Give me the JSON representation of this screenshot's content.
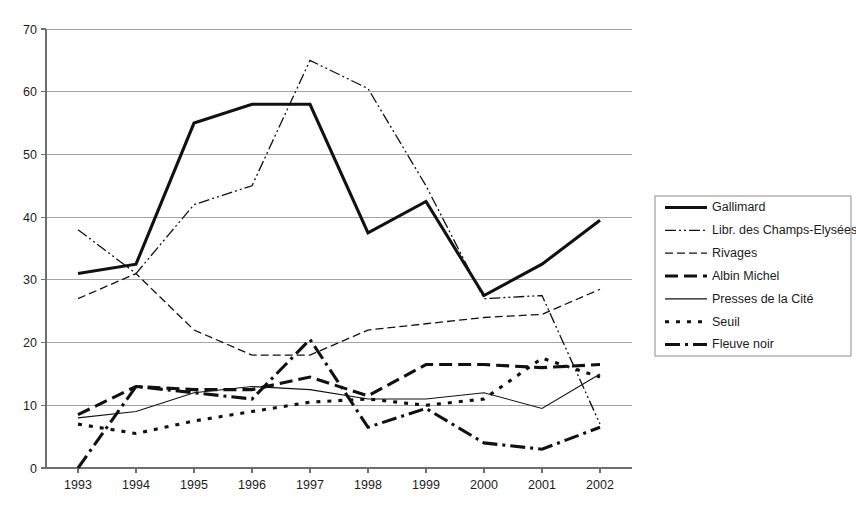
{
  "chart_data": {
    "type": "line",
    "title": "",
    "xlabel": "",
    "ylabel": "",
    "x": [
      1993,
      1994,
      1995,
      1996,
      1997,
      1998,
      1999,
      2000,
      2001,
      2002
    ],
    "categories": [
      "1993",
      "1994",
      "1995",
      "1996",
      "1997",
      "1998",
      "1999",
      "2000",
      "2001",
      "2002"
    ],
    "ylim": [
      0,
      70
    ],
    "yticks": [
      0,
      10,
      20,
      30,
      40,
      50,
      60,
      70
    ],
    "ytick_labels": [
      "0",
      "10",
      "20",
      "30",
      "40",
      "50",
      "60",
      "70"
    ],
    "grid": true,
    "grid_axis": "y",
    "legend_position": "right",
    "series": [
      {
        "name": "Gallimard",
        "values": [
          31,
          32.5,
          55,
          58,
          58,
          37.5,
          42.5,
          27.5,
          32.5,
          39.5
        ],
        "style": "solid-thick",
        "width": 3.1,
        "dash": ""
      },
      {
        "name": "Libr. des Champs-Elysées",
        "values": [
          38,
          31,
          42,
          45,
          65,
          60.5,
          45,
          27,
          27.5,
          7
        ],
        "style": "dash-dot-dot",
        "width": 1.3,
        "dash": "11,3,2,3,2,3"
      },
      {
        "name": "Rivages",
        "values": [
          27,
          31,
          22,
          18,
          18,
          22,
          23,
          24,
          24.5,
          28.5
        ],
        "style": "dashed",
        "width": 1.3,
        "dash": "8,4"
      },
      {
        "name": "Albin Michel",
        "values": [
          8.5,
          13,
          12.5,
          12.5,
          14.5,
          11.5,
          16.5,
          16.5,
          16,
          16.5
        ],
        "style": "dashed-thick",
        "width": 3.1,
        "dash": "13,6"
      },
      {
        "name": "Presses de la Cité",
        "values": [
          8,
          9,
          12,
          13,
          12.5,
          11,
          11,
          12,
          9.5,
          15
        ],
        "style": "solid-thin",
        "width": 1.1,
        "dash": ""
      },
      {
        "name": "Seuil",
        "values": [
          7,
          5.5,
          7.5,
          9,
          10.5,
          11,
          10,
          11,
          17.5,
          14.5
        ],
        "style": "dotted-thick",
        "width": 3.1,
        "dash": "4,7"
      },
      {
        "name": "Fleuve noir",
        "values": [
          0,
          13,
          12,
          11,
          20.5,
          6.5,
          9.5,
          4,
          3,
          6.5
        ],
        "style": "dash-dot-thick",
        "width": 3.1,
        "dash": "15,5,3,5"
      }
    ]
  },
  "legend": {
    "items": [
      {
        "label": "Gallimard"
      },
      {
        "label": "Libr. des Champs-Elysées"
      },
      {
        "label": "Rivages"
      },
      {
        "label": "Albin Michel"
      },
      {
        "label": "Presses de la Cité"
      },
      {
        "label": "Seuil"
      },
      {
        "label": "Fleuve noir"
      }
    ]
  },
  "colors": {
    "line": "#111111",
    "grid": "#9a9a9a",
    "axis": "#6e6e6e",
    "text": "#1c1c1c",
    "background": "#ffffff"
  }
}
